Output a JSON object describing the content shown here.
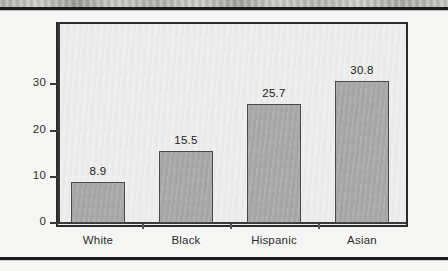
{
  "page": {
    "background_color": "#f6f6f4",
    "rule_color": "#1d1d1d"
  },
  "chart_data": {
    "type": "bar",
    "title": "",
    "subtitle": "",
    "xlabel": "",
    "ylabel": "",
    "categories": [
      "White",
      "Black",
      "Hispanic",
      "Asian"
    ],
    "values": [
      8.9,
      15.5,
      25.7,
      30.8
    ],
    "value_labels": [
      "8.9",
      "15.5",
      "25.7",
      "30.8"
    ],
    "series": [
      {
        "name": "",
        "values": [
          8.9,
          15.5,
          25.7,
          30.8
        ]
      }
    ],
    "ylim": [
      0,
      43.5
    ],
    "y_ticks": [
      0,
      10,
      20,
      30
    ],
    "y_tick_labels": [
      "0",
      "10",
      "20",
      "30"
    ],
    "x_ticks_between_bars": true,
    "grid": false,
    "legend": false,
    "legend_position": "none",
    "bar_fill_color": "#a9a9a9",
    "bar_border_color": "#4a4a4a",
    "plot_background_color": "#ecedec",
    "plot_border_color": "#2b2b2b",
    "axis_color": "#3a3a3a",
    "text_color": "#2c2c2c"
  }
}
